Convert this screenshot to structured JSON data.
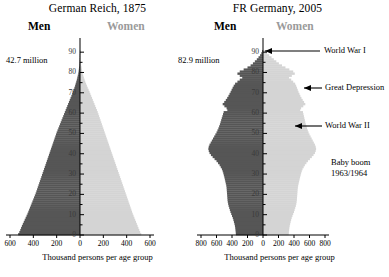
{
  "charts": [
    {
      "id": "german-reich-1875",
      "title": "German Reich, 1875",
      "men_label": "Men",
      "women_label": "Women",
      "total_population": "42.7 million",
      "x_axis_title": "Thousand persons per age group",
      "x_ticks": [
        "600",
        "400",
        "200",
        "0",
        "200",
        "400",
        "600"
      ],
      "y_ticks": [
        "90",
        "80",
        "70",
        "60",
        "50",
        "40",
        "30",
        "20",
        "10",
        "0"
      ],
      "annotations": []
    },
    {
      "id": "fr-germany-2005",
      "title": "FR Germany, 2005",
      "men_label": "Men",
      "women_label": "Women",
      "total_population": "82.9 million",
      "x_axis_title": "Thousand persons per age group",
      "x_ticks": [
        "800",
        "600",
        "400",
        "200",
        "0",
        "200",
        "400",
        "600",
        "800"
      ],
      "y_ticks": [
        "90",
        "80",
        "70",
        "60",
        "50",
        "40",
        "30",
        "20",
        "10",
        "0"
      ],
      "annotations": [
        {
          "label": "World War I",
          "age": 89,
          "arrow": "long"
        },
        {
          "label": "Great Depression",
          "age": 74,
          "arrow": "short"
        },
        {
          "label": "Great Depression",
          "age": 74,
          "arrow": "short"
        },
        {
          "label": "World War II",
          "age": 61,
          "arrow": "medium"
        },
        {
          "label": "Baby boom",
          "age": 42,
          "arrow": "none"
        },
        {
          "label": "1963/1964",
          "age": 42,
          "arrow": "none"
        }
      ],
      "annotation_lines": [
        "World War I",
        "Great Depression",
        "World War II",
        "Baby boom",
        "1963/1964"
      ]
    }
  ],
  "colors": {
    "male": "#565656",
    "female": "#d4d4d4",
    "axis": "#000000",
    "women_label": "#9a9a9a",
    "background": "#ffffff"
  },
  "chart_data": {
    "type": "bar",
    "xlabel": "Thousand persons per age group",
    "ylabel": "Age",
    "grid": false,
    "legend": [
      "Men",
      "Women"
    ],
    "legend_position": "top",
    "panels": [
      {
        "name": "German Reich, 1875",
        "total_population_millions": 42.7,
        "xlim": [
          -600,
          600
        ],
        "ylim": [
          0,
          95
        ],
        "xticks": [
          -600,
          -400,
          -200,
          0,
          200,
          400,
          600
        ],
        "yticks": [
          0,
          10,
          20,
          30,
          40,
          50,
          60,
          70,
          80,
          90
        ],
        "ages": [
          0,
          1,
          2,
          3,
          4,
          5,
          6,
          7,
          8,
          9,
          10,
          11,
          12,
          13,
          14,
          15,
          16,
          17,
          18,
          19,
          20,
          21,
          22,
          23,
          24,
          25,
          26,
          27,
          28,
          29,
          30,
          31,
          32,
          33,
          34,
          35,
          36,
          37,
          38,
          39,
          40,
          41,
          42,
          43,
          44,
          45,
          46,
          47,
          48,
          49,
          50,
          51,
          52,
          53,
          54,
          55,
          56,
          57,
          58,
          59,
          60,
          61,
          62,
          63,
          64,
          65,
          66,
          67,
          68,
          69,
          70,
          71,
          72,
          73,
          74,
          75,
          76,
          77,
          78,
          79,
          80,
          81,
          82,
          83,
          84,
          85,
          86,
          87,
          88,
          89,
          90
        ],
        "series": [
          {
            "name": "Men",
            "color": "#565656",
            "values": [
              530,
              520,
              512,
              505,
              498,
              490,
              482,
              474,
              466,
              458,
              450,
              443,
              436,
              429,
              422,
              415,
              408,
              401,
              394,
              387,
              380,
              374,
              368,
              362,
              356,
              350,
              344,
              338,
              332,
              326,
              320,
              314,
              308,
              302,
              296,
              290,
              284,
              278,
              272,
              266,
              260,
              254,
              248,
              242,
              236,
              230,
              224,
              218,
              212,
              206,
              200,
              193,
              186,
              179,
              172,
              165,
              158,
              151,
              144,
              137,
              130,
              123,
              116,
              109,
              102,
              95,
              88,
              81,
              74,
              67,
              60,
              54,
              48,
              42,
              37,
              32,
              27,
              23,
              19,
              15,
              12,
              10,
              8,
              6,
              5,
              4,
              3,
              2,
              2,
              1,
              1
            ]
          },
          {
            "name": "Women",
            "color": "#d4d4d4",
            "values": [
              525,
              516,
              508,
              501,
              494,
              487,
              480,
              473,
              466,
              459,
              452,
              446,
              440,
              434,
              428,
              422,
              416,
              410,
              404,
              398,
              392,
              386,
              380,
              374,
              368,
              362,
              356,
              350,
              344,
              338,
              332,
              326,
              320,
              314,
              308,
              302,
              296,
              290,
              284,
              278,
              272,
              266,
              260,
              254,
              248,
              242,
              236,
              230,
              224,
              218,
              212,
              206,
              200,
              194,
              188,
              182,
              176,
              170,
              164,
              158,
              152,
              145,
              138,
              131,
              124,
              117,
              110,
              103,
              96,
              89,
              82,
              74,
              66,
              59,
              52,
              45,
              39,
              33,
              28,
              23,
              19,
              16,
              13,
              10,
              8,
              6,
              5,
              4,
              3,
              2,
              1
            ]
          }
        ]
      },
      {
        "name": "FR Germany, 2005",
        "total_population_millions": 82.9,
        "xlim": [
          -800,
          800
        ],
        "ylim": [
          0,
          95
        ],
        "xticks": [
          -800,
          -600,
          -400,
          -200,
          0,
          200,
          400,
          600,
          800
        ],
        "yticks": [
          0,
          10,
          20,
          30,
          40,
          50,
          60,
          70,
          80,
          90
        ],
        "ages": [
          0,
          1,
          2,
          3,
          4,
          5,
          6,
          7,
          8,
          9,
          10,
          11,
          12,
          13,
          14,
          15,
          16,
          17,
          18,
          19,
          20,
          21,
          22,
          23,
          24,
          25,
          26,
          27,
          28,
          29,
          30,
          31,
          32,
          33,
          34,
          35,
          36,
          37,
          38,
          39,
          40,
          41,
          42,
          43,
          44,
          45,
          46,
          47,
          48,
          49,
          50,
          51,
          52,
          53,
          54,
          55,
          56,
          57,
          58,
          59,
          60,
          61,
          62,
          63,
          64,
          65,
          66,
          67,
          68,
          69,
          70,
          71,
          72,
          73,
          74,
          75,
          76,
          77,
          78,
          79,
          80,
          81,
          82,
          83,
          84,
          85,
          86,
          87,
          88,
          89,
          90
        ],
        "series": [
          {
            "name": "Men",
            "color": "#565656",
            "values": [
              350,
              352,
              355,
              358,
              362,
              368,
              375,
              382,
              390,
              400,
              410,
              420,
              428,
              436,
              444,
              450,
              455,
              458,
              460,
              462,
              464,
              466,
              468,
              470,
              474,
              480,
              486,
              492,
              498,
              505,
              512,
              520,
              530,
              545,
              560,
              580,
              600,
              625,
              650,
              672,
              690,
              700,
              705,
              700,
              690,
              675,
              660,
              645,
              630,
              615,
              600,
              588,
              576,
              566,
              556,
              548,
              540,
              532,
              524,
              516,
              508,
              460,
              470,
              498,
              520,
              500,
              480,
              462,
              446,
              432,
              418,
              405,
              392,
              378,
              360,
              330,
              300,
              268,
              300,
              330,
              300,
              250,
              200,
              160,
              130,
              105,
              80,
              58,
              38,
              22,
              12
            ]
          },
          {
            "name": "Women",
            "color": "#d4d4d4",
            "values": [
              332,
              334,
              337,
              340,
              344,
              350,
              356,
              363,
              370,
              380,
              390,
              400,
              408,
              416,
              424,
              430,
              434,
              437,
              439,
              441,
              443,
              445,
              447,
              450,
              454,
              460,
              466,
              472,
              478,
              485,
              492,
              500,
              510,
              525,
              540,
              560,
              580,
              605,
              630,
              652,
              670,
              680,
              685,
              680,
              670,
              656,
              642,
              628,
              614,
              600,
              588,
              578,
              568,
              560,
              552,
              546,
              540,
              534,
              528,
              522,
              516,
              480,
              492,
              520,
              546,
              530,
              512,
              496,
              482,
              470,
              458,
              448,
              438,
              428,
              415,
              390,
              364,
              336,
              372,
              410,
              390,
              340,
              290,
              245,
              205,
              172,
              140,
              110,
              80,
              52,
              30
            ]
          }
        ]
      }
    ],
    "annotations": [
      {
        "panel": "FR Germany, 2005",
        "text": "World War I",
        "age": 89
      },
      {
        "panel": "FR Germany, 2005",
        "text": "Great Depression",
        "age": 74
      },
      {
        "panel": "FR Germany, 2005",
        "text": "World War II",
        "age": 61
      },
      {
        "panel": "FR Germany, 2005",
        "text": "Baby boom 1963/1964",
        "age": 42
      }
    ]
  }
}
